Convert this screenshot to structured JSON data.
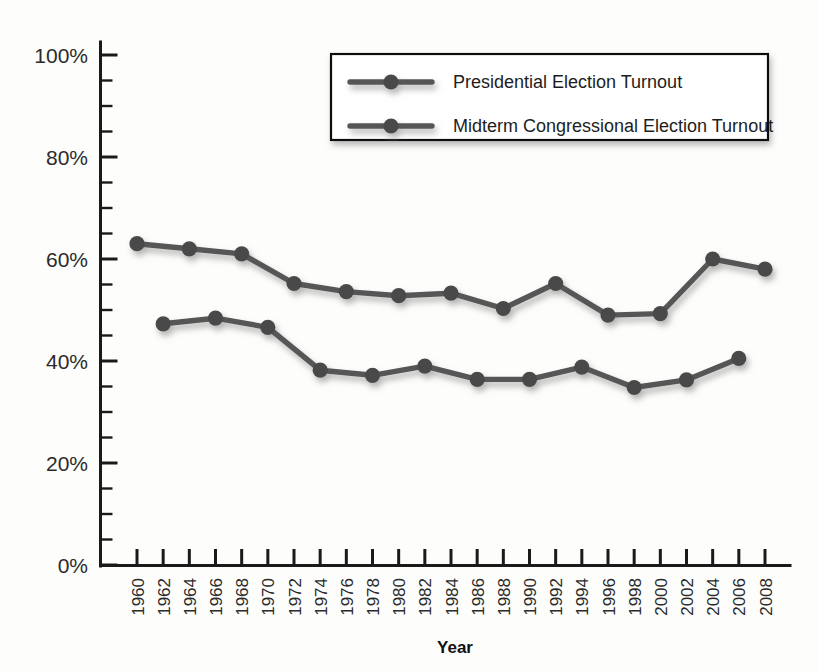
{
  "chart_data": {
    "type": "line",
    "title": "",
    "xlabel": "Year",
    "ylabel": "",
    "ylim": [
      0,
      100
    ],
    "yunit": "%",
    "ytick_labels": [
      "0%",
      "20%",
      "40%",
      "60%",
      "80%",
      "100%"
    ],
    "ytick_values": [
      0,
      20,
      40,
      60,
      80,
      100
    ],
    "yminor_step": 5,
    "grid": false,
    "legend_position": "top-right",
    "x": [
      1960,
      1962,
      1964,
      1966,
      1968,
      1970,
      1972,
      1974,
      1976,
      1978,
      1980,
      1982,
      1984,
      1986,
      1988,
      1990,
      1992,
      1994,
      1996,
      1998,
      2000,
      2002,
      2004,
      2006,
      2008
    ],
    "xtick_labels": [
      "1960",
      "1962",
      "1964",
      "1966",
      "1968",
      "1970",
      "1972",
      "1974",
      "1976",
      "1978",
      "1980",
      "1982",
      "1984",
      "1986",
      "1988",
      "1990",
      "1992",
      "1994",
      "1996",
      "1998",
      "2000",
      "2002",
      "2004",
      "2006",
      "2008"
    ],
    "series": [
      {
        "name": "Presidential Election Turnout",
        "color": "#575757",
        "points": [
          {
            "x": 1960,
            "y": 63.0
          },
          {
            "x": 1964,
            "y": 62.0
          },
          {
            "x": 1968,
            "y": 61.0
          },
          {
            "x": 1972,
            "y": 55.2
          },
          {
            "x": 1976,
            "y": 53.6
          },
          {
            "x": 1980,
            "y": 52.8
          },
          {
            "x": 1984,
            "y": 53.3
          },
          {
            "x": 1988,
            "y": 50.3
          },
          {
            "x": 1992,
            "y": 55.2
          },
          {
            "x": 1996,
            "y": 49.0
          },
          {
            "x": 2000,
            "y": 49.3
          },
          {
            "x": 2004,
            "y": 60.0
          },
          {
            "x": 2008,
            "y": 58.0
          }
        ]
      },
      {
        "name": "Midterm Congressional Election Turnout",
        "color": "#575757",
        "points": [
          {
            "x": 1962,
            "y": 47.3
          },
          {
            "x": 1966,
            "y": 48.4
          },
          {
            "x": 1970,
            "y": 46.6
          },
          {
            "x": 1974,
            "y": 38.2
          },
          {
            "x": 1978,
            "y": 37.2
          },
          {
            "x": 1982,
            "y": 39.0
          },
          {
            "x": 1986,
            "y": 36.4
          },
          {
            "x": 1990,
            "y": 36.4
          },
          {
            "x": 1994,
            "y": 38.8
          },
          {
            "x": 1998,
            "y": 34.8
          },
          {
            "x": 2002,
            "y": 36.3
          },
          {
            "x": 2006,
            "y": 40.5
          }
        ]
      }
    ]
  },
  "legend": {
    "items": [
      {
        "label": "Presidential Election Turnout"
      },
      {
        "label": "Midterm Congressional Election Turnout"
      }
    ]
  }
}
